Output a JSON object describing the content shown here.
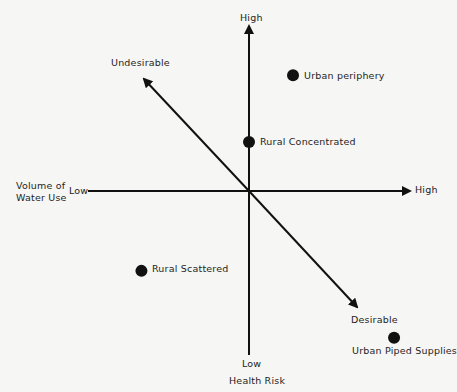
{
  "diagram": {
    "vertical_axis": {
      "title": "Health Risk",
      "high_label": "High",
      "low_label": "Low"
    },
    "horizontal_axis": {
      "title_line1": "Volume of",
      "title_line2": "Water Use",
      "low_label": "Low",
      "high_label": "High"
    },
    "diagonal": {
      "undesirable_label": "Undesirable",
      "desirable_label": "Desirable"
    },
    "points": [
      {
        "label": "Urban periphery",
        "volume": 0.27,
        "risk": 0.71
      },
      {
        "label": "Rural Concentrated",
        "volume": 0.0,
        "risk": 0.3
      },
      {
        "label": "Rural Scattered",
        "volume": -0.66,
        "risk": -0.49
      },
      {
        "label": "Urban Piped Supplies",
        "volume": 0.89,
        "risk": -0.9
      }
    ],
    "colors": {
      "ink": "#111111",
      "background": "#f6f6f4"
    }
  }
}
